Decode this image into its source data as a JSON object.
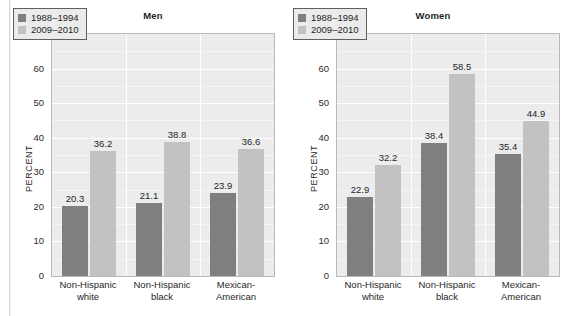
{
  "figure": {
    "background_color": "#ffffff",
    "plot_background_color": "#ececec",
    "gridline_color": "#ffffff",
    "series_colors": [
      "#7f7f7f",
      "#c2c2c2"
    ]
  },
  "chart_data": [
    {
      "type": "bar",
      "title": "Men",
      "xlabel": "",
      "ylabel": "PERCENT",
      "ylim": [
        0,
        70
      ],
      "ytick_step": 10,
      "yticks": [
        0,
        10,
        20,
        30,
        40,
        50,
        60,
        70
      ],
      "grid": true,
      "legend_position": "top-left",
      "categories": [
        "Non-Hispanic white",
        "Non-Hispanic black",
        "Mexican-American"
      ],
      "category_lines": [
        [
          "Non-Hispanic",
          "white"
        ],
        [
          "Non-Hispanic",
          "black"
        ],
        [
          "Mexican-",
          "American"
        ]
      ],
      "series": [
        {
          "name": "1988–1994",
          "color": "#7f7f7f",
          "values": [
            20.3,
            21.1,
            23.9
          ]
        },
        {
          "name": "2009–2010",
          "color": "#c2c2c2",
          "values": [
            36.2,
            38.8,
            36.6
          ]
        }
      ]
    },
    {
      "type": "bar",
      "title": "Women",
      "xlabel": "",
      "ylabel": "PERCENT",
      "ylim": [
        0,
        70
      ],
      "ytick_step": 10,
      "yticks": [
        0,
        10,
        20,
        30,
        40,
        50,
        60,
        70
      ],
      "grid": true,
      "legend_position": "top-left",
      "categories": [
        "Non-Hispanic white",
        "Non-Hispanic black",
        "Mexican-American"
      ],
      "category_lines": [
        [
          "Non-Hispanic",
          "white"
        ],
        [
          "Non-Hispanic",
          "black"
        ],
        [
          "Mexican-",
          "American"
        ]
      ],
      "series": [
        {
          "name": "1988–1994",
          "color": "#7f7f7f",
          "values": [
            22.9,
            38.4,
            35.4
          ]
        },
        {
          "name": "2009–2010",
          "color": "#c2c2c2",
          "values": [
            32.2,
            58.5,
            44.9
          ]
        }
      ]
    }
  ]
}
